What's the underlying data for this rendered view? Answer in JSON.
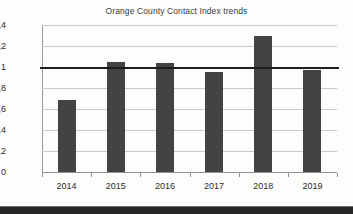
{
  "chart_data": {
    "type": "bar",
    "title": "Orange County Contact Index trends",
    "xlabel": "",
    "ylabel": "",
    "categories": [
      "2014",
      "2015",
      "2016",
      "2017",
      "2018",
      "2019"
    ],
    "values": [
      0.69,
      1.05,
      1.04,
      0.95,
      1.3,
      0.97
    ],
    "ylim": [
      0,
      1.4
    ],
    "ytick_values": [
      0,
      0.2,
      0.4,
      0.6,
      0.8,
      1.0,
      1.2,
      1.4
    ],
    "ytick_labels": [
      "0",
      "0,2",
      "0,4",
      "0,6",
      "0,8",
      "1",
      "1,2",
      "1,4"
    ],
    "decimal_separator": ",",
    "grid": true,
    "legend": null,
    "reference_line": {
      "value": 1.0,
      "label": "",
      "color": "#1d1d1d"
    },
    "colors": {
      "bar": "#434343",
      "gridline": "#c9c9c9",
      "axis": "#8f8f8f",
      "text": "#2b2b2b",
      "title": "#3b3b3b",
      "background": "#fdfdfc"
    }
  }
}
